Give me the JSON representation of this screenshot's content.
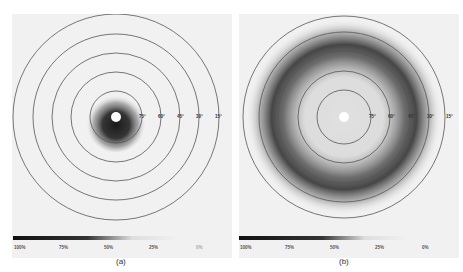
{
  "figure": {
    "panels": [
      {
        "id": "a",
        "caption": "(a)",
        "center": [
          104,
          103
        ],
        "ring_labels": [
          "75°",
          "60°",
          "45°",
          "30°",
          "15°"
        ],
        "ring_radii": [
          26,
          45,
          64,
          83,
          103
        ],
        "scale_labels": [
          "100%",
          "75%",
          "50%",
          "25%",
          "0%"
        ],
        "pattern": "central-spot"
      },
      {
        "id": "b",
        "caption": "(b)",
        "center": [
          105,
          103
        ],
        "ring_labels": [
          "75°",
          "60°",
          "45°",
          "30°",
          "15°"
        ],
        "ring_radii": [
          27,
          46,
          66,
          85,
          101
        ],
        "scale_labels": [
          "100%",
          "75%",
          "50%",
          "25%",
          "0%"
        ],
        "pattern": "annular-ring"
      }
    ]
  },
  "colors": {
    "background": "#f1f1f1",
    "ring_stroke": "#555555",
    "intensity_max": "#1a1a1a",
    "intensity_min": "#f1f1f1"
  }
}
